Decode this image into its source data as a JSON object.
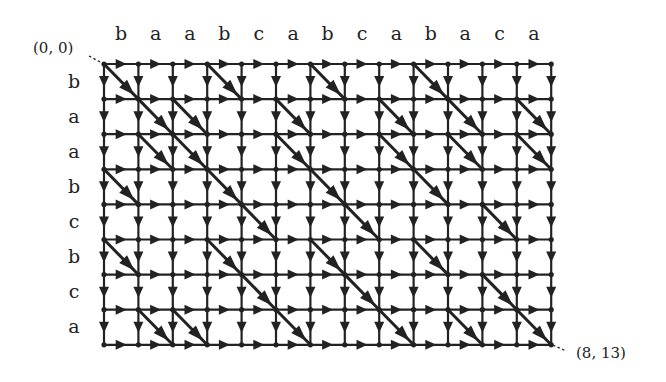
{
  "diagram": {
    "column_string": [
      "b",
      "a",
      "a",
      "b",
      "c",
      "a",
      "b",
      "c",
      "a",
      "b",
      "a",
      "c",
      "a"
    ],
    "row_string": [
      "b",
      "a",
      "a",
      "b",
      "c",
      "b",
      "c",
      "a"
    ],
    "start_label": "(0, 0)",
    "end_label": "(8, 13)",
    "colors": {
      "edge": "#222222",
      "diagonal": "#222222",
      "background": "#ffffff"
    },
    "grid": {
      "origin_x": 104,
      "origin_y": 64,
      "col_spacing": 34.4,
      "row_spacing": 35.1,
      "cols": 13,
      "rows": 8
    },
    "edge_rule": "horizontal and vertical edges everywhere; diagonal edge from (i-1,j-1) to (i,j) when row_string[i-1] == column_string[j-1]"
  }
}
